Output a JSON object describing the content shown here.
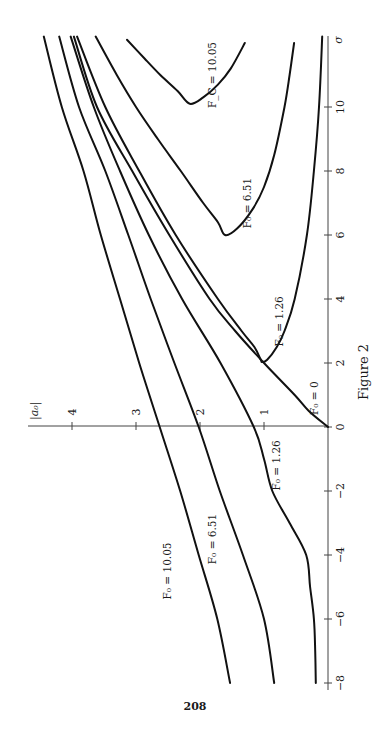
{
  "chart_data": {
    "type": "line",
    "title": "Figure 2",
    "orientation": "rotated-90-ccw",
    "xlabel": "σ",
    "ylabel": "|a0|",
    "xlim": [
      -8,
      12.2
    ],
    "ylim": [
      0,
      4.5
    ],
    "x_ticks": [
      -8,
      -6,
      -4,
      -2,
      0,
      2,
      4,
      6,
      8,
      10
    ],
    "x_tick_labels": [
      "−8",
      "−6",
      "−4",
      "−2",
      "0",
      "2",
      "4",
      "6",
      "8",
      "10"
    ],
    "y_ticks": [
      1,
      2,
      3,
      4
    ],
    "y_tick_labels": [
      "1",
      "2",
      "3",
      "4"
    ],
    "grid": false,
    "series": [
      {
        "name": "F0 = 10.05 (left branch)",
        "label": "F₀ = 10.05",
        "points": [
          [
            -8,
            1.53
          ],
          [
            -6,
            1.73
          ],
          [
            -4,
            2.02
          ],
          [
            -2,
            2.31
          ],
          [
            0,
            2.63
          ],
          [
            2,
            2.95
          ],
          [
            4,
            3.25
          ],
          [
            6,
            3.55
          ],
          [
            8,
            3.82
          ],
          [
            10,
            4.16
          ],
          [
            12.2,
            4.44
          ]
        ]
      },
      {
        "name": "F0 = 6.51 (left branch)",
        "label": "F₀ = 6.51",
        "points": [
          [
            -8,
            0.84
          ],
          [
            -6,
            1.0
          ],
          [
            -4,
            1.33
          ],
          [
            -2,
            1.69
          ],
          [
            0,
            2.02
          ],
          [
            2,
            2.4
          ],
          [
            4,
            2.77
          ],
          [
            6,
            3.12
          ],
          [
            8,
            3.48
          ],
          [
            10,
            3.89
          ],
          [
            12.2,
            4.2
          ]
        ]
      },
      {
        "name": "F0 = 1.26 (left branch)",
        "label": "F₀ = 1.26",
        "points": [
          [
            -8,
            0.19
          ],
          [
            -7,
            0.2
          ],
          [
            -6,
            0.22
          ],
          [
            -5,
            0.28
          ],
          [
            -4,
            0.34
          ],
          [
            -3,
            0.6
          ],
          [
            -2,
            0.87
          ],
          [
            -1,
            1.0
          ],
          [
            0,
            1.16
          ],
          [
            2,
            1.68
          ],
          [
            4,
            2.28
          ],
          [
            6,
            2.8
          ],
          [
            8,
            3.25
          ],
          [
            10,
            3.66
          ],
          [
            12.2,
            4.02
          ]
        ]
      },
      {
        "name": "F0 = 0",
        "label": "F₀ = 0",
        "points": [
          [
            0,
            0
          ],
          [
            0.5,
            0.3
          ],
          [
            1,
            0.52
          ],
          [
            2,
            1.0
          ],
          [
            3,
            1.45
          ],
          [
            4,
            1.85
          ],
          [
            6,
            2.48
          ],
          [
            8,
            3.06
          ],
          [
            10,
            3.61
          ],
          [
            12.2,
            3.97
          ]
        ]
      },
      {
        "name": "F0 = 1.26 (U-curve)",
        "label": "F₀ = 1.26",
        "points": [
          [
            12.2,
            3.92
          ],
          [
            10,
            3.48
          ],
          [
            8,
            2.95
          ],
          [
            6,
            2.38
          ],
          [
            4,
            1.72
          ],
          [
            3,
            1.35
          ],
          [
            2.5,
            1.15
          ],
          [
            2.1,
            1.05
          ],
          [
            2.03,
            1.03
          ],
          [
            2.1,
            0.95
          ],
          [
            2.5,
            0.8
          ],
          [
            3,
            0.68
          ],
          [
            4,
            0.52
          ],
          [
            6,
            0.33
          ],
          [
            8,
            0.22
          ],
          [
            10,
            0.14
          ],
          [
            12.2,
            0.09
          ]
        ]
      },
      {
        "name": "F0 = 6.51 (U-curve)",
        "label": "F₀ = 6.51",
        "points": [
          [
            12.2,
            3.63
          ],
          [
            11,
            3.3
          ],
          [
            10,
            3.0
          ],
          [
            9,
            2.66
          ],
          [
            8,
            2.3
          ],
          [
            7,
            1.95
          ],
          [
            6.4,
            1.72
          ],
          [
            6.0,
            1.61
          ],
          [
            6.2,
            1.42
          ],
          [
            6.8,
            1.18
          ],
          [
            7.5,
            1.0
          ],
          [
            8.5,
            0.84
          ],
          [
            10,
            0.68
          ],
          [
            11,
            0.6
          ],
          [
            12.0,
            0.53
          ]
        ]
      },
      {
        "name": "FC = 10.05 (U-curve)",
        "label": "F_C = 10.05",
        "points": [
          [
            12.1,
            3.14
          ],
          [
            11.5,
            2.86
          ],
          [
            11,
            2.62
          ],
          [
            10.5,
            2.35
          ],
          [
            10.1,
            2.16
          ],
          [
            10.3,
            1.95
          ],
          [
            10.7,
            1.72
          ],
          [
            11.2,
            1.52
          ],
          [
            12.0,
            1.3
          ]
        ]
      }
    ],
    "annotations": [
      {
        "text": "F₀ = 10.05",
        "sigma": -4.5,
        "a0": 2.45
      },
      {
        "text": "F₀ = 6.51",
        "sigma": -3.5,
        "a0": 1.75
      },
      {
        "text": "F₀ = 1.26",
        "sigma": -1.2,
        "a0": 0.75
      },
      {
        "text": "F₀ = 0",
        "sigma": 0.9,
        "a0": 0.15
      },
      {
        "text": "F₀ = 1.26",
        "sigma": 3.3,
        "a0": 0.7
      },
      {
        "text": "F₀ = 6.51",
        "sigma": 7.0,
        "a0": 1.2
      },
      {
        "text": "F_C = 10.05",
        "sigma": 11.0,
        "a0": 1.75
      }
    ]
  },
  "caption": "Figure 2",
  "page_number": "208",
  "axis_labels": {
    "sigma": "σ",
    "a0": "|a₀|"
  }
}
